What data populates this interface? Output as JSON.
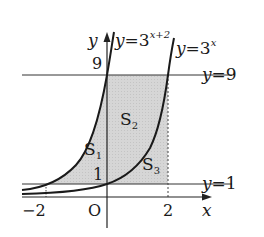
{
  "figure": {
    "type": "graph-of-exponential-functions",
    "axes": {
      "x_label": "x",
      "y_label": "y",
      "origin_label": "O",
      "x_ticks": [
        "−2",
        "2"
      ],
      "y_ticks": [
        "1",
        "9"
      ]
    },
    "curves": [
      {
        "name": "curve-3-pow-x-plus-2",
        "label_prefix": "y=3",
        "label_exponent": "x+2"
      },
      {
        "name": "curve-3-pow-x",
        "label_prefix": "y=3",
        "label_exponent": "x"
      }
    ],
    "lines": [
      {
        "name": "line-y-9",
        "label": "y=9"
      },
      {
        "name": "line-y-1",
        "label": "y=1"
      }
    ],
    "regions": [
      {
        "name": "region-s1",
        "label_main": "S",
        "label_sub": "1"
      },
      {
        "name": "region-s2",
        "label_main": "S",
        "label_sub": "2"
      },
      {
        "name": "region-s3",
        "label_main": "S",
        "label_sub": "3"
      }
    ],
    "colors": {
      "stroke": "#1a1a1a",
      "shade": "#d4d4d4",
      "thin_line": "#333333"
    }
  }
}
